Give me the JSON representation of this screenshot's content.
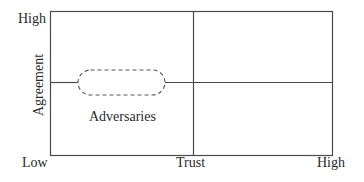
{
  "diagram": {
    "y_axis": {
      "title": "Agreement",
      "high_label": "High",
      "low_label": "Low"
    },
    "x_axis": {
      "title": "Trust",
      "high_label": "High"
    },
    "regions": [
      {
        "label": "Adversaries",
        "quadrant": "low-trust / mid-agreement",
        "shape": "dashed-pill"
      }
    ],
    "colors": {
      "line": "#4a4a4a",
      "text": "#2a2a2a",
      "background": "#ffffff"
    }
  }
}
